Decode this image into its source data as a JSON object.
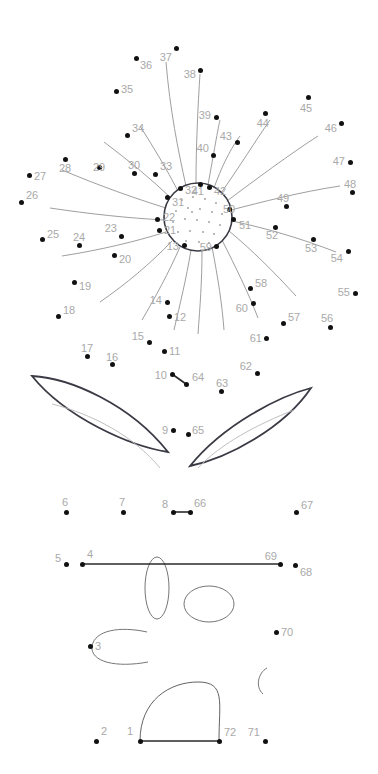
{
  "puzzle": {
    "type": "connect-the-dots",
    "subject": "sunflower in a pot",
    "dot_count": 72,
    "colors": {
      "background": "#ffffff",
      "dot": "#111111",
      "label": "#a9a9a9",
      "outline_dark": "#3a3a45",
      "guide_light": "#8c8c8c",
      "seed": "#9a9a9a"
    },
    "dots": [
      {
        "n": "1",
        "x": 140,
        "y": 741,
        "lx": 133,
        "ly": 731,
        "align": "lbl-l"
      },
      {
        "n": "2",
        "x": 96,
        "y": 741,
        "lx": 101,
        "ly": 731,
        "align": "lbl-r"
      },
      {
        "n": "3",
        "x": 90,
        "y": 646,
        "lx": 95,
        "ly": 646,
        "align": "lbl-r"
      },
      {
        "n": "4",
        "x": 82,
        "y": 564,
        "lx": 87,
        "ly": 554,
        "align": "lbl-r"
      },
      {
        "n": "5",
        "x": 66,
        "y": 564,
        "lx": 61,
        "ly": 558,
        "align": "lbl-l"
      },
      {
        "n": "6",
        "x": 66,
        "y": 512,
        "lx": 65,
        "ly": 502,
        "align": "lbl-c"
      },
      {
        "n": "7",
        "x": 123,
        "y": 512,
        "lx": 122,
        "ly": 502,
        "align": "lbl-c"
      },
      {
        "n": "8",
        "x": 173,
        "y": 512,
        "lx": 168,
        "ly": 504,
        "align": "lbl-l"
      },
      {
        "n": "9",
        "x": 173,
        "y": 430,
        "lx": 168,
        "ly": 430,
        "align": "lbl-l"
      },
      {
        "n": "10",
        "x": 172,
        "y": 374,
        "lx": 167,
        "ly": 375,
        "align": "lbl-l"
      },
      {
        "n": "11",
        "x": 164,
        "y": 351,
        "lx": 169,
        "ly": 351,
        "align": "lbl-r"
      },
      {
        "n": "12",
        "x": 169,
        "y": 316,
        "lx": 174,
        "ly": 317,
        "align": "lbl-r"
      },
      {
        "n": "13",
        "x": 184,
        "y": 245,
        "lx": 179,
        "ly": 246,
        "align": "lbl-l"
      },
      {
        "n": "14",
        "x": 167,
        "y": 302,
        "lx": 162,
        "ly": 300,
        "align": "lbl-l"
      },
      {
        "n": "15",
        "x": 149,
        "y": 342,
        "lx": 144,
        "ly": 336,
        "align": "lbl-l"
      },
      {
        "n": "16",
        "x": 112,
        "y": 364,
        "lx": 112,
        "ly": 357,
        "align": "lbl-c"
      },
      {
        "n": "17",
        "x": 87,
        "y": 356,
        "lx": 87,
        "ly": 348,
        "align": "lbl-c"
      },
      {
        "n": "18",
        "x": 58,
        "y": 316,
        "lx": 63,
        "ly": 310,
        "align": "lbl-r"
      },
      {
        "n": "19",
        "x": 74,
        "y": 282,
        "lx": 79,
        "ly": 286,
        "align": "lbl-r"
      },
      {
        "n": "20",
        "x": 114,
        "y": 255,
        "lx": 119,
        "ly": 259,
        "align": "lbl-r"
      },
      {
        "n": "21",
        "x": 159,
        "y": 230,
        "lx": 164,
        "ly": 230,
        "align": "lbl-r"
      },
      {
        "n": "22",
        "x": 157,
        "y": 219,
        "lx": 163,
        "ly": 217,
        "align": "lbl-r"
      },
      {
        "n": "23",
        "x": 121,
        "y": 236,
        "lx": 117,
        "ly": 228,
        "align": "lbl-l"
      },
      {
        "n": "24",
        "x": 79,
        "y": 245,
        "lx": 79,
        "ly": 237,
        "align": "lbl-c"
      },
      {
        "n": "25",
        "x": 42,
        "y": 239,
        "lx": 47,
        "ly": 234,
        "align": "lbl-r"
      },
      {
        "n": "26",
        "x": 21,
        "y": 202,
        "lx": 26,
        "ly": 195,
        "align": "lbl-r"
      },
      {
        "n": "27",
        "x": 29,
        "y": 175,
        "lx": 34,
        "ly": 176,
        "align": "lbl-r"
      },
      {
        "n": "28",
        "x": 65,
        "y": 159,
        "lx": 65,
        "ly": 168,
        "align": "lbl-c"
      },
      {
        "n": "29",
        "x": 99,
        "y": 167,
        "lx": 99,
        "ly": 167,
        "align": "lbl-c"
      },
      {
        "n": "30",
        "x": 134,
        "y": 173,
        "lx": 134,
        "ly": 165,
        "align": "lbl-c"
      },
      {
        "n": "31",
        "x": 167,
        "y": 197,
        "lx": 172,
        "ly": 202,
        "align": "lbl-r"
      },
      {
        "n": "32",
        "x": 180,
        "y": 188,
        "lx": 185,
        "ly": 190,
        "align": "lbl-r"
      },
      {
        "n": "33",
        "x": 155,
        "y": 174,
        "lx": 160,
        "ly": 166,
        "align": "lbl-r"
      },
      {
        "n": "34",
        "x": 127,
        "y": 135,
        "lx": 132,
        "ly": 128,
        "align": "lbl-r"
      },
      {
        "n": "35",
        "x": 116,
        "y": 91,
        "lx": 121,
        "ly": 89,
        "align": "lbl-r"
      },
      {
        "n": "36",
        "x": 136,
        "y": 58,
        "lx": 140,
        "ly": 65,
        "align": "lbl-r"
      },
      {
        "n": "37",
        "x": 176,
        "y": 48,
        "lx": 172,
        "ly": 57,
        "align": "lbl-l"
      },
      {
        "n": "38",
        "x": 200,
        "y": 70,
        "lx": 196,
        "ly": 74,
        "align": "lbl-l"
      },
      {
        "n": "39",
        "x": 216,
        "y": 117,
        "lx": 211,
        "ly": 115,
        "align": "lbl-l"
      },
      {
        "n": "40",
        "x": 213,
        "y": 155,
        "lx": 209,
        "ly": 148,
        "align": "lbl-l"
      },
      {
        "n": "41",
        "x": 200,
        "y": 184,
        "lx": 204,
        "ly": 191,
        "align": "lbl-l"
      },
      {
        "n": "42",
        "x": 209,
        "y": 187,
        "lx": 214,
        "ly": 191,
        "align": "lbl-r"
      },
      {
        "n": "43",
        "x": 237,
        "y": 142,
        "lx": 232,
        "ly": 136,
        "align": "lbl-l"
      },
      {
        "n": "44",
        "x": 265,
        "y": 113,
        "lx": 269,
        "ly": 123,
        "align": "lbl-l"
      },
      {
        "n": "45",
        "x": 308,
        "y": 97,
        "lx": 306,
        "ly": 108,
        "align": "lbl-c"
      },
      {
        "n": "46",
        "x": 341,
        "y": 123,
        "lx": 337,
        "ly": 128,
        "align": "lbl-l"
      },
      {
        "n": "47",
        "x": 350,
        "y": 162,
        "lx": 345,
        "ly": 161,
        "align": "lbl-l"
      },
      {
        "n": "48",
        "x": 352,
        "y": 192,
        "lx": 350,
        "ly": 184,
        "align": "lbl-c"
      },
      {
        "n": "49",
        "x": 286,
        "y": 206,
        "lx": 283,
        "ly": 198,
        "align": "lbl-c"
      },
      {
        "n": "50",
        "x": 229,
        "y": 209,
        "lx": 223,
        "ly": 209,
        "align": "lbl-r"
      },
      {
        "n": "51",
        "x": 233,
        "y": 219,
        "lx": 239,
        "ly": 225,
        "align": "lbl-r"
      },
      {
        "n": "52",
        "x": 275,
        "y": 227,
        "lx": 272,
        "ly": 235,
        "align": "lbl-c"
      },
      {
        "n": "53",
        "x": 313,
        "y": 239,
        "lx": 311,
        "ly": 248,
        "align": "lbl-c"
      },
      {
        "n": "54",
        "x": 348,
        "y": 251,
        "lx": 343,
        "ly": 258,
        "align": "lbl-l"
      },
      {
        "n": "55",
        "x": 355,
        "y": 293,
        "lx": 350,
        "ly": 292,
        "align": "lbl-l"
      },
      {
        "n": "56",
        "x": 330,
        "y": 327,
        "lx": 327,
        "ly": 318,
        "align": "lbl-c"
      },
      {
        "n": "57",
        "x": 283,
        "y": 323,
        "lx": 288,
        "ly": 317,
        "align": "lbl-r"
      },
      {
        "n": "58",
        "x": 250,
        "y": 288,
        "lx": 255,
        "ly": 283,
        "align": "lbl-r"
      },
      {
        "n": "59",
        "x": 216,
        "y": 246,
        "lx": 212,
        "ly": 247,
        "align": "lbl-l"
      },
      {
        "n": "60",
        "x": 253,
        "y": 303,
        "lx": 248,
        "ly": 308,
        "align": "lbl-l"
      },
      {
        "n": "61",
        "x": 266,
        "y": 338,
        "lx": 262,
        "ly": 338,
        "align": "lbl-l"
      },
      {
        "n": "62",
        "x": 257,
        "y": 373,
        "lx": 252,
        "ly": 366,
        "align": "lbl-l"
      },
      {
        "n": "63",
        "x": 221,
        "y": 391,
        "lx": 222,
        "ly": 383,
        "align": "lbl-c"
      },
      {
        "n": "64",
        "x": 186,
        "y": 384,
        "lx": 192,
        "ly": 377,
        "align": "lbl-r"
      },
      {
        "n": "65",
        "x": 188,
        "y": 434,
        "lx": 192,
        "ly": 430,
        "align": "lbl-r"
      },
      {
        "n": "66",
        "x": 190,
        "y": 512,
        "lx": 194,
        "ly": 503,
        "align": "lbl-r"
      },
      {
        "n": "67",
        "x": 296,
        "y": 512,
        "lx": 301,
        "ly": 505,
        "align": "lbl-r"
      },
      {
        "n": "68",
        "x": 295,
        "y": 565,
        "lx": 300,
        "ly": 572,
        "align": "lbl-r"
      },
      {
        "n": "69",
        "x": 280,
        "y": 564,
        "lx": 277,
        "ly": 556,
        "align": "lbl-l"
      },
      {
        "n": "70",
        "x": 276,
        "y": 632,
        "lx": 281,
        "ly": 632,
        "align": "lbl-r"
      },
      {
        "n": "71",
        "x": 265,
        "y": 741,
        "lx": 260,
        "ly": 732,
        "align": "lbl-l"
      },
      {
        "n": "72",
        "x": 219,
        "y": 741,
        "lx": 224,
        "ly": 732,
        "align": "lbl-r"
      }
    ],
    "segments": [
      {
        "name": "segment-10-64",
        "from": "10",
        "to": "64"
      },
      {
        "name": "segment-8-66",
        "from": "8",
        "to": "66"
      },
      {
        "name": "segment-4-69",
        "from": "4",
        "to": "69"
      },
      {
        "name": "segment-1-72",
        "from": "1",
        "to": "72"
      }
    ],
    "shapes": [
      {
        "name": "flower-center-circle",
        "kind": "circle",
        "cx": 198,
        "cy": 217,
        "r": 34
      },
      {
        "name": "leaf-left",
        "kind": "leaf"
      },
      {
        "name": "leaf-right",
        "kind": "leaf"
      },
      {
        "name": "pot-arc-bottom",
        "kind": "arc"
      },
      {
        "name": "narrow-ellipse",
        "kind": "ellipse"
      },
      {
        "name": "wide-ellipse",
        "kind": "ellipse"
      },
      {
        "name": "c-curve-left",
        "kind": "open-curve"
      },
      {
        "name": "c-curve-right",
        "kind": "open-curve"
      }
    ]
  }
}
